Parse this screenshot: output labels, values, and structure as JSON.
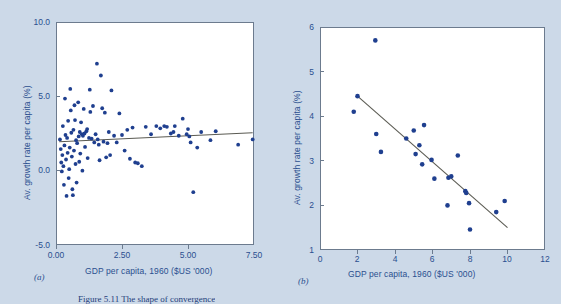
{
  "figure": {
    "caption": "Figure 5.11  The shape of convergence",
    "background_color": "#ccd9e8",
    "marker_color": "#1f3f8f",
    "trendline_color": "#5a5a52",
    "label_color": "#2a4f8f"
  },
  "panel_a": {
    "label": "(a)",
    "xlabel": "GDP per capita, 1960 ($US '000)",
    "ylabel": "Av. growth rate per capita (%)",
    "xticks": [
      "0.00",
      "2.50",
      "5.00",
      "7.50"
    ],
    "yticks": [
      "10.0",
      "5.0",
      "0.0",
      "-5.0"
    ]
  },
  "panel_b": {
    "label": "(b)",
    "xlabel": "GDP per capita, 1960 ($US '000)",
    "ylabel": "Av. growth rate per capita (%)",
    "xticks": [
      "0",
      "2",
      "4",
      "6",
      "8",
      "10",
      "12"
    ],
    "yticks": [
      "6",
      "5",
      "4",
      "3",
      "2",
      "1"
    ]
  },
  "chart_data": [
    {
      "type": "scatter",
      "id": "panel-a",
      "title": "(a)",
      "xlabel": "GDP per capita, 1960 ($US '000)",
      "ylabel": "Av. growth rate per capita (%)",
      "xlim": [
        0.0,
        7.5
      ],
      "ylim": [
        -5.0,
        10.0
      ],
      "xticks": [
        0.0,
        2.5,
        5.0,
        7.5
      ],
      "yticks": [
        -5.0,
        0.0,
        5.0,
        10.0
      ],
      "grid": false,
      "legend": null,
      "trendline": {
        "x": [
          0.12,
          7.45
        ],
        "y": [
          1.95,
          2.55
        ]
      },
      "points": [
        [
          0.15,
          2.1
        ],
        [
          0.18,
          1.45
        ],
        [
          0.2,
          0.55
        ],
        [
          0.22,
          -0.05
        ],
        [
          0.24,
          1.05
        ],
        [
          0.26,
          3.0
        ],
        [
          0.28,
          0.3
        ],
        [
          0.3,
          -0.95
        ],
        [
          0.32,
          1.7
        ],
        [
          0.34,
          4.85
        ],
        [
          0.36,
          2.4
        ],
        [
          0.38,
          0.75
        ],
        [
          0.4,
          -1.7
        ],
        [
          0.42,
          2.2
        ],
        [
          0.44,
          1.2
        ],
        [
          0.46,
          3.35
        ],
        [
          0.48,
          -0.5
        ],
        [
          0.5,
          0.1
        ],
        [
          0.52,
          1.55
        ],
        [
          0.54,
          5.5
        ],
        [
          0.56,
          4.05
        ],
        [
          0.58,
          2.55
        ],
        [
          0.6,
          0.95
        ],
        [
          0.62,
          -1.25
        ],
        [
          0.64,
          -1.65
        ],
        [
          0.66,
          2.75
        ],
        [
          0.68,
          1.35
        ],
        [
          0.7,
          4.4
        ],
        [
          0.72,
          3.4
        ],
        [
          0.74,
          0.45
        ],
        [
          0.76,
          2.05
        ],
        [
          0.78,
          -0.8
        ],
        [
          0.8,
          1.85
        ],
        [
          0.84,
          4.6
        ],
        [
          0.86,
          2.3
        ],
        [
          0.88,
          0.6
        ],
        [
          0.9,
          2.6
        ],
        [
          0.92,
          1.15
        ],
        [
          0.95,
          3.25
        ],
        [
          0.98,
          2.45
        ],
        [
          1.0,
          0.0
        ],
        [
          1.02,
          2.35
        ],
        [
          1.05,
          4.15
        ],
        [
          1.08,
          2.5
        ],
        [
          1.1,
          1.6
        ],
        [
          1.15,
          2.65
        ],
        [
          1.18,
          2.8
        ],
        [
          1.2,
          0.85
        ],
        [
          1.25,
          2.2
        ],
        [
          1.28,
          5.45
        ],
        [
          1.3,
          3.95
        ],
        [
          1.35,
          2.15
        ],
        [
          1.4,
          4.35
        ],
        [
          1.45,
          1.9
        ],
        [
          1.5,
          2.45
        ],
        [
          1.55,
          7.2
        ],
        [
          1.58,
          2.1
        ],
        [
          1.62,
          1.75
        ],
        [
          1.65,
          0.7
        ],
        [
          1.7,
          6.4
        ],
        [
          1.75,
          4.2
        ],
        [
          1.8,
          1.95
        ],
        [
          1.85,
          3.9
        ],
        [
          1.9,
          0.9
        ],
        [
          1.95,
          1.85
        ],
        [
          2.0,
          2.6
        ],
        [
          2.05,
          1.05
        ],
        [
          2.1,
          5.4
        ],
        [
          2.2,
          2.35
        ],
        [
          2.3,
          1.9
        ],
        [
          2.4,
          3.85
        ],
        [
          2.5,
          2.4
        ],
        [
          2.6,
          1.35
        ],
        [
          2.7,
          2.75
        ],
        [
          2.8,
          0.8
        ],
        [
          2.9,
          2.9
        ],
        [
          3.0,
          0.55
        ],
        [
          3.1,
          0.5
        ],
        [
          3.25,
          0.3
        ],
        [
          3.4,
          2.95
        ],
        [
          3.6,
          2.45
        ],
        [
          3.8,
          3.0
        ],
        [
          3.95,
          2.85
        ],
        [
          4.1,
          3.0
        ],
        [
          4.2,
          2.95
        ],
        [
          4.35,
          2.5
        ],
        [
          4.45,
          2.6
        ],
        [
          4.5,
          3.0
        ],
        [
          4.65,
          2.35
        ],
        [
          4.8,
          3.5
        ],
        [
          4.95,
          2.45
        ],
        [
          5.0,
          2.8
        ],
        [
          5.05,
          2.3
        ],
        [
          5.1,
          1.9
        ],
        [
          5.2,
          -1.45
        ],
        [
          5.35,
          1.55
        ],
        [
          5.5,
          2.6
        ],
        [
          5.85,
          2.05
        ],
        [
          6.05,
          2.65
        ],
        [
          6.9,
          1.75
        ],
        [
          7.45,
          2.1
        ]
      ]
    },
    {
      "type": "scatter",
      "id": "panel-b",
      "title": "(b)",
      "xlabel": "GDP per capita, 1960 ($US '000)",
      "ylabel": "Av. growth rate per capita (%)",
      "xlim": [
        0,
        12
      ],
      "ylim": [
        1,
        6
      ],
      "xticks": [
        0,
        2,
        4,
        6,
        8,
        10,
        12
      ],
      "yticks": [
        1,
        2,
        3,
        4,
        5,
        6
      ],
      "grid": false,
      "legend": null,
      "trendline": {
        "x": [
          2.0,
          10.0
        ],
        "y": [
          4.45,
          1.5
        ]
      },
      "points": [
        [
          1.8,
          4.1
        ],
        [
          2.0,
          4.45
        ],
        [
          2.95,
          5.7
        ],
        [
          3.0,
          3.6
        ],
        [
          3.25,
          3.2
        ],
        [
          4.6,
          3.5
        ],
        [
          5.0,
          3.68
        ],
        [
          5.1,
          3.15
        ],
        [
          5.3,
          3.35
        ],
        [
          5.45,
          2.92
        ],
        [
          5.55,
          3.8
        ],
        [
          5.95,
          3.02
        ],
        [
          6.1,
          2.6
        ],
        [
          6.8,
          2.0
        ],
        [
          6.85,
          2.62
        ],
        [
          7.0,
          2.65
        ],
        [
          7.35,
          3.12
        ],
        [
          7.75,
          2.32
        ],
        [
          7.8,
          2.28
        ],
        [
          7.95,
          2.05
        ],
        [
          8.0,
          1.46
        ],
        [
          9.4,
          1.85
        ],
        [
          9.85,
          2.1
        ]
      ]
    }
  ]
}
